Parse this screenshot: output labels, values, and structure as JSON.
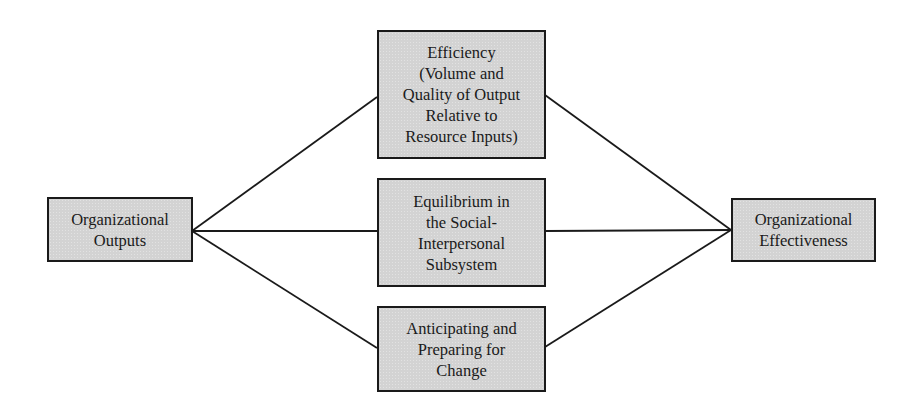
{
  "diagram": {
    "type": "flow",
    "colors": {
      "box_fill": "#d3d3d3",
      "box_border": "#1a1a1a",
      "line": "#1a1a1a",
      "background": "#ffffff"
    },
    "nodes": {
      "outputs": {
        "lines": [
          "Organizational",
          "Outputs"
        ]
      },
      "efficiency": {
        "lines": [
          "Efficiency",
          "(Volume and",
          "Quality of Output",
          "Relative to",
          "Resource Inputs)"
        ]
      },
      "equilibrium": {
        "lines": [
          "Equilibrium in",
          "the Social-",
          "Interpersonal",
          "Subsystem"
        ]
      },
      "change": {
        "lines": [
          "Anticipating and",
          "Preparing for",
          "Change"
        ]
      },
      "effectiveness": {
        "lines": [
          "Organizational",
          "Effectiveness"
        ]
      }
    },
    "edges": [
      {
        "from": "outputs",
        "to": "efficiency"
      },
      {
        "from": "outputs",
        "to": "equilibrium"
      },
      {
        "from": "outputs",
        "to": "change"
      },
      {
        "from": "efficiency",
        "to": "effectiveness"
      },
      {
        "from": "equilibrium",
        "to": "effectiveness"
      },
      {
        "from": "change",
        "to": "effectiveness"
      }
    ]
  }
}
